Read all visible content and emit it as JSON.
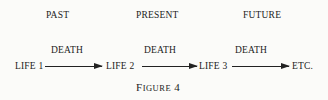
{
  "eras": [
    "PAST",
    "PRESENT",
    "FUTURE"
  ],
  "transition_label": "DEATH",
  "stages": [
    "LIFE 1",
    "LIFE 2",
    "LIFE 3",
    "ETC."
  ],
  "caption": {
    "first": "F",
    "rest": "IGURE",
    "number": "4"
  }
}
